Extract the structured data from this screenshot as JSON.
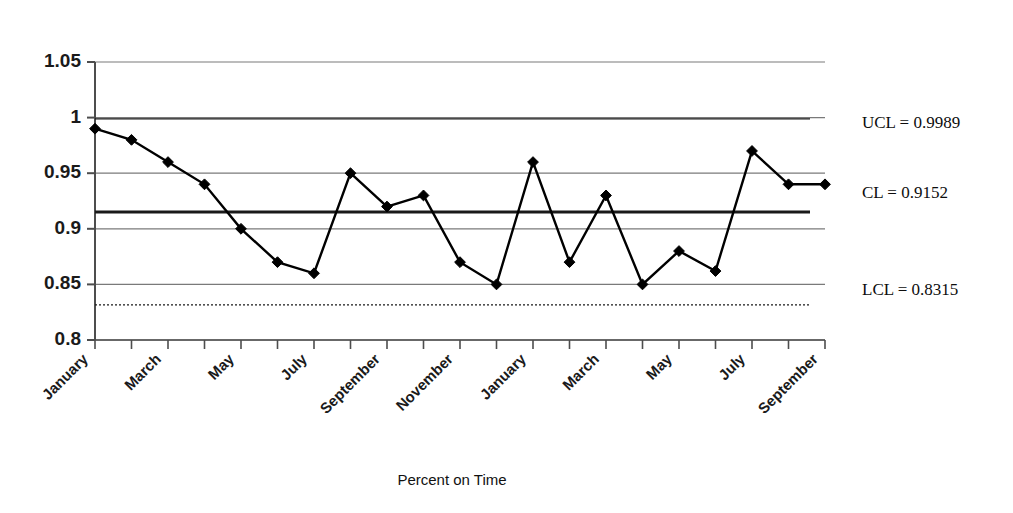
{
  "chart_data": {
    "type": "line",
    "title": "",
    "xlabel": "Percent on Time",
    "ylabel": "",
    "ylim": [
      0.8,
      1.05
    ],
    "ytick_values": [
      1.05,
      1.0,
      0.95,
      0.9,
      0.85,
      0.8
    ],
    "ytick_labels": [
      "1.05",
      "1",
      "0.95",
      "0.9",
      "0.85",
      "0.8"
    ],
    "grid": true,
    "grid_axis": "y",
    "legend": "none",
    "marker": "diamond",
    "x": [
      "January",
      "February",
      "March",
      "April",
      "May",
      "June",
      "July",
      "August",
      "September",
      "October",
      "November",
      "December",
      "January",
      "February",
      "March",
      "April",
      "May",
      "June",
      "July",
      "August",
      "September"
    ],
    "xtick_labels_shown": [
      "January",
      "March",
      "May",
      "July",
      "September",
      "November",
      "January",
      "March",
      "May",
      "July",
      "September"
    ],
    "xtick_label_rotation": 45,
    "values": [
      0.99,
      0.98,
      0.96,
      0.94,
      0.9,
      0.87,
      0.86,
      0.95,
      0.92,
      0.93,
      0.87,
      0.85,
      0.96,
      0.87,
      0.93,
      0.85,
      0.88,
      0.862,
      0.97,
      0.94,
      0.94
    ],
    "control_limits": {
      "ucl": 0.9989,
      "cl": 0.9152,
      "lcl": 0.8315,
      "ucl_label": "UCL = 0.9989",
      "cl_label": "CL = 0.9152",
      "lcl_label": "LCL = 0.8315",
      "ucl_style": "thin-solid",
      "cl_style": "thick-solid",
      "lcl_style": "thin-dotted"
    },
    "colors": {
      "series": "#000000",
      "grid": "#7a7a7a",
      "axis": "#4d4d4d",
      "limit_line": "#1a1a1a"
    }
  }
}
